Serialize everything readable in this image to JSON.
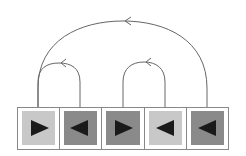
{
  "diagram": {
    "colors": {
      "frame": "#888888",
      "light_cell": "#c8c8c8",
      "dark_cell": "#8a8a8a",
      "triangle": "#1a1a1a",
      "arc": "#555555"
    },
    "cells": [
      {
        "index": 0,
        "shade": "light",
        "direction": "right"
      },
      {
        "index": 1,
        "shade": "dark",
        "direction": "left"
      },
      {
        "index": 2,
        "shade": "dark",
        "direction": "right"
      },
      {
        "index": 3,
        "shade": "light",
        "direction": "left"
      },
      {
        "index": 4,
        "shade": "dark",
        "direction": "left"
      }
    ],
    "arcs": [
      {
        "from": 4,
        "to": 0,
        "label": ""
      },
      {
        "from": 1,
        "to": 0,
        "label": ""
      },
      {
        "from": 3,
        "to": 2,
        "label": ""
      }
    ]
  }
}
